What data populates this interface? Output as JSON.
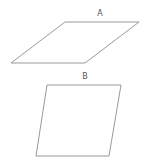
{
  "diagram": {
    "background": "#ffffff",
    "stroke_color": "#9a9a9a",
    "label_color": "#555555",
    "shapes": [
      {
        "id": "A",
        "label": "A",
        "type": "parallelogram",
        "points": "65,22 139,22 85,63 11,63",
        "label_pos": {
          "x": 100,
          "y": 16
        }
      },
      {
        "id": "B",
        "label": "B",
        "type": "parallelogram",
        "points": "47,85 121,85 109,156 36,156",
        "label_pos": {
          "x": 85,
          "y": 79
        }
      }
    ]
  }
}
